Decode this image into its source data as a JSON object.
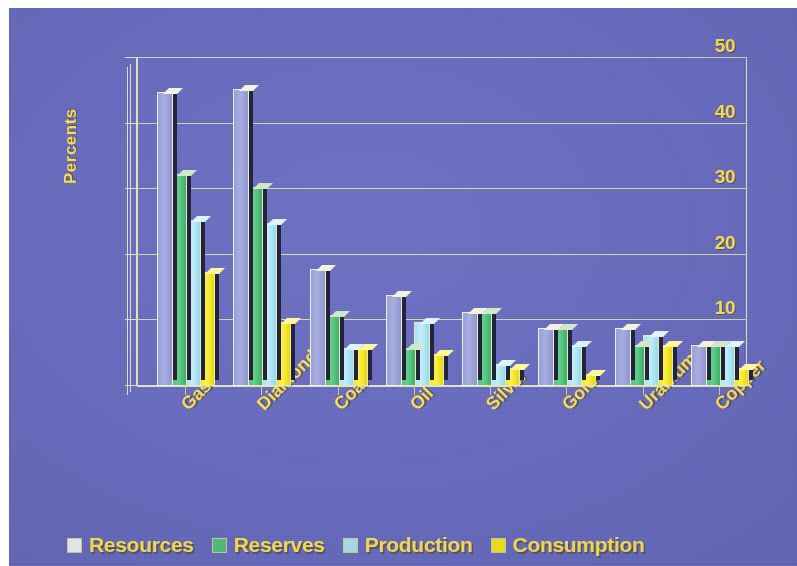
{
  "chart_data": {
    "type": "bar",
    "title": "",
    "xlabel": "",
    "ylabel": "Percents",
    "ylim": [
      0,
      50
    ],
    "ytick_values": [
      0,
      10,
      20,
      30,
      40,
      50
    ],
    "ytick_labels": [
      "0",
      "10",
      "20",
      "30",
      "40",
      "50"
    ],
    "grid": true,
    "legend_position": "bottom",
    "categories": [
      "Gas",
      "Diamonds",
      "Coal",
      "Oil",
      "Silver",
      "Gold",
      "Uranium",
      "Copper"
    ],
    "series": [
      {
        "name": "Resources",
        "color": "#eef0fb",
        "values": [
          44.5,
          45.0,
          17.5,
          13.5,
          11.0,
          8.5,
          8.5,
          6.0
        ]
      },
      {
        "name": "Reserves",
        "color": "#4fc07a",
        "values": [
          32.0,
          30.0,
          10.5,
          5.5,
          11.0,
          8.5,
          6.0,
          6.0
        ]
      },
      {
        "name": "Production",
        "color": "#a9e4f2",
        "values": [
          25.0,
          24.5,
          5.5,
          9.5,
          3.0,
          6.0,
          7.5,
          6.0
        ]
      },
      {
        "name": "Consumption",
        "color": "#f3e518",
        "values": [
          17.0,
          9.5,
          5.5,
          4.5,
          2.5,
          1.5,
          6.0,
          2.5
        ]
      }
    ]
  },
  "style": {
    "background_color": "#6569c0",
    "text_color": "#ffe14d",
    "grid_color": "#d8d8a8",
    "axis_color": "#e8e8c0"
  }
}
